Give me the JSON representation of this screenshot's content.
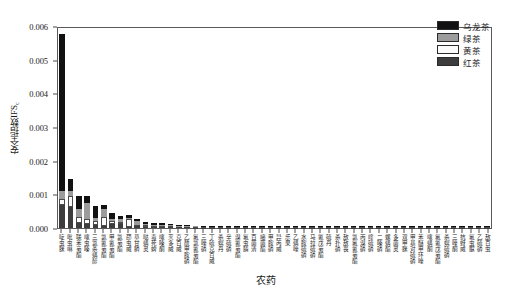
{
  "chart_data": {
    "type": "bar",
    "stacked": true,
    "title": "",
    "xlabel": "农药",
    "ylabel": "安全指数IFS",
    "ylabel_sub": "c",
    "ylim": [
      0.0,
      0.006
    ],
    "ytick_labels": [
      "0.000",
      "0.001",
      "0.002",
      "0.003",
      "0.004",
      "0.005",
      "0.006"
    ],
    "ytick_values": [
      0.0,
      0.001,
      0.002,
      0.003,
      0.004,
      0.005,
      0.006
    ],
    "grid": false,
    "legend_position": "top-right",
    "series": [
      {
        "name": "乌龙茶",
        "color": "#111111",
        "values": [
          0.00466,
          0.00035,
          0.0004,
          0.00021,
          0.00036,
          0.00011,
          0.00016,
          0.0001,
          0.0001,
          4e-05,
          7e-05,
          6e-05,
          5e-05,
          4e-05,
          3e-05,
          3e-05,
          2e-05,
          2e-05,
          2e-05,
          1.5e-05,
          1.2e-05,
          1e-05,
          1e-05,
          8e-06,
          8e-06,
          7e-06,
          6e-06,
          6e-06,
          5e-06,
          5e-06,
          4e-06,
          4e-06,
          4e-06,
          3e-06,
          3e-06,
          3e-06,
          2e-06,
          2e-06,
          2e-06,
          2e-06,
          1.5e-06,
          1.5e-06,
          1e-06,
          1e-06,
          1e-06,
          1e-06,
          8e-07,
          8e-07,
          5e-07,
          5e-07,
          3e-07,
          2e-07
        ]
      },
      {
        "name": "绿茶",
        "color": "#9c9c9c",
        "values": [
          0.00022,
          0.00014,
          0.00022,
          0.00048,
          9e-05,
          0.00024,
          8e-05,
          8e-05,
          4e-05,
          0.00012,
          4e-05,
          3e-05,
          3e-05,
          3e-05,
          3e-05,
          2e-05,
          2e-05,
          1.5e-05,
          1.2e-05,
          1e-05,
          1e-05,
          8e-06,
          8e-06,
          6e-06,
          6e-06,
          5e-06,
          5e-06,
          4e-06,
          4e-06,
          4e-06,
          3e-06,
          3e-06,
          3e-06,
          2e-06,
          2e-06,
          2e-06,
          2e-06,
          1.5e-06,
          1.5e-06,
          1e-06,
          1e-06,
          1e-06,
          1e-06,
          8e-07,
          8e-07,
          5e-07,
          5e-07,
          5e-07,
          3e-07,
          3e-07,
          2e-07,
          1e-07
        ]
      },
      {
        "name": "黄茶",
        "color": "#fbfbfb",
        "values": [
          0.0002,
          0.00035,
          0.0002,
          0.00015,
          0.00012,
          0.00026,
          7e-05,
          6e-05,
          0.00022,
          5e-05,
          4e-05,
          3e-05,
          3e-05,
          2e-05,
          2e-05,
          2e-05,
          1.5e-05,
          1.2e-05,
          1e-05,
          1e-05,
          8e-06,
          8e-06,
          6e-06,
          6e-06,
          5e-06,
          5e-06,
          4e-06,
          4e-06,
          3e-06,
          3e-06,
          3e-06,
          2e-06,
          2e-06,
          2e-06,
          2e-06,
          1.5e-06,
          1.5e-06,
          1e-06,
          1e-06,
          1e-06,
          1e-06,
          8e-07,
          8e-07,
          5e-07,
          5e-07,
          5e-07,
          3e-07,
          3e-07,
          2e-07,
          2e-07,
          1e-07,
          1e-07
        ]
      },
      {
        "name": "红茶",
        "color": "#3d3d3d",
        "values": [
          0.00067,
          0.00061,
          0.00014,
          0.00012,
          9e-05,
          7e-05,
          0.00013,
          0.00012,
          4e-05,
          5e-05,
          4e-05,
          4e-05,
          3e-05,
          3e-05,
          2e-05,
          2e-05,
          1.5e-05,
          1.2e-05,
          1e-05,
          1e-05,
          8e-06,
          8e-06,
          6e-06,
          6e-06,
          5e-06,
          5e-06,
          4e-06,
          4e-06,
          3e-06,
          3e-06,
          2e-06,
          2e-06,
          2e-06,
          2e-06,
          1.5e-06,
          1.5e-06,
          1e-06,
          1e-06,
          1e-06,
          1e-06,
          8e-07,
          8e-07,
          5e-07,
          5e-07,
          5e-07,
          3e-07,
          3e-07,
          2e-07,
          2e-07,
          1e-07,
          1e-07,
          1e-07
        ]
      }
    ],
    "categories": [
      "啶虫脒",
      "吡虫啉",
      "联苯菊酯",
      "噻虫嗪",
      "三氯杀螨醇",
      "氯氰菊酯",
      "甲氰菊酯",
      "氯菊酯",
      "茚虫威",
      "草甘膦",
      "哒螨灵",
      "毒死蜱",
      "噻嗪酮",
      "灭多威",
      "克百威",
      "乙酰甲胺磷",
      "氟氯氰菊酯",
      "三唑磷",
      "丁硫克百威",
      "杀螟丹",
      "辛硫磷",
      "溴氰菊酯",
      "氟虫腈",
      "百菌清",
      "嘧菌酯",
      "甲胺磷",
      "异丙威",
      "乐果",
      "乙螨唑",
      "水胺硫磷",
      "马拉硫磷",
      "氰戊菊酯",
      "硫丹",
      "杀扑磷",
      "敌敌畏",
      "氯氟氰菊酯",
      "丙溴磷",
      "喹硫磷",
      "二嗪磷",
      "螺螨酯",
      "多菌灵",
      "双甲脒",
      "甲基对硫磷",
      "苯醚甲环唑",
      "噻螨酮",
      "氟氰戊菊酯",
      "杀螟硫磷",
      "三唑酮",
      "抗蚜威",
      "氟虫脲",
      "乙硫磷",
      "敌百虫"
    ]
  },
  "legend": {
    "items": [
      {
        "label": "乌龙茶",
        "key": "oolong"
      },
      {
        "label": "绿茶",
        "key": "green"
      },
      {
        "label": "黄茶",
        "key": "yellow"
      },
      {
        "label": "红茶",
        "key": "black"
      }
    ]
  }
}
